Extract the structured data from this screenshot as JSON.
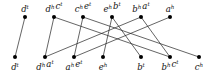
{
  "diagram": {
    "top_nodes": [
      {
        "id": "t0",
        "label": [
          [
            "d",
            "t"
          ]
        ]
      },
      {
        "id": "t1",
        "label": [
          [
            "d",
            "h"
          ],
          [
            "c",
            "t"
          ]
        ]
      },
      {
        "id": "t2",
        "label": [
          [
            "c",
            "h"
          ],
          [
            "e",
            "t"
          ]
        ]
      },
      {
        "id": "t3",
        "label": [
          [
            "e",
            "h"
          ],
          [
            "b",
            "t"
          ]
        ]
      },
      {
        "id": "t4",
        "label": [
          [
            "b",
            "h"
          ],
          [
            "a",
            "t"
          ]
        ]
      },
      {
        "id": "t5",
        "label": [
          [
            "a",
            "h"
          ]
        ]
      }
    ],
    "bottom_nodes": [
      {
        "id": "b0",
        "label": [
          [
            "d",
            "t"
          ]
        ]
      },
      {
        "id": "b1",
        "label": [
          [
            "d",
            "h"
          ],
          [
            "a",
            "t"
          ]
        ]
      },
      {
        "id": "b2",
        "label": [
          [
            "a",
            "h"
          ],
          [
            "e",
            "t"
          ]
        ]
      },
      {
        "id": "b3",
        "label": [
          [
            "e",
            "h"
          ]
        ]
      },
      {
        "id": "b4",
        "label": [
          [
            "b",
            "t"
          ]
        ]
      },
      {
        "id": "b5",
        "label": [
          [
            "b",
            "h"
          ],
          [
            "c",
            "t"
          ]
        ]
      },
      {
        "id": "b6",
        "label": [
          [
            "c",
            "h"
          ]
        ]
      }
    ],
    "edges": [
      [
        "t0",
        "b0"
      ],
      [
        "t1",
        "b1"
      ],
      [
        "t1",
        "b5"
      ],
      [
        "t2",
        "b2"
      ],
      [
        "t2",
        "b6"
      ],
      [
        "t3",
        "b3"
      ],
      [
        "t3",
        "b4"
      ],
      [
        "t4",
        "b1"
      ],
      [
        "t4",
        "b5"
      ],
      [
        "t5",
        "b2"
      ]
    ],
    "colors": {
      "edge": "#222222",
      "node": "#000000",
      "text": "#111111"
    }
  }
}
